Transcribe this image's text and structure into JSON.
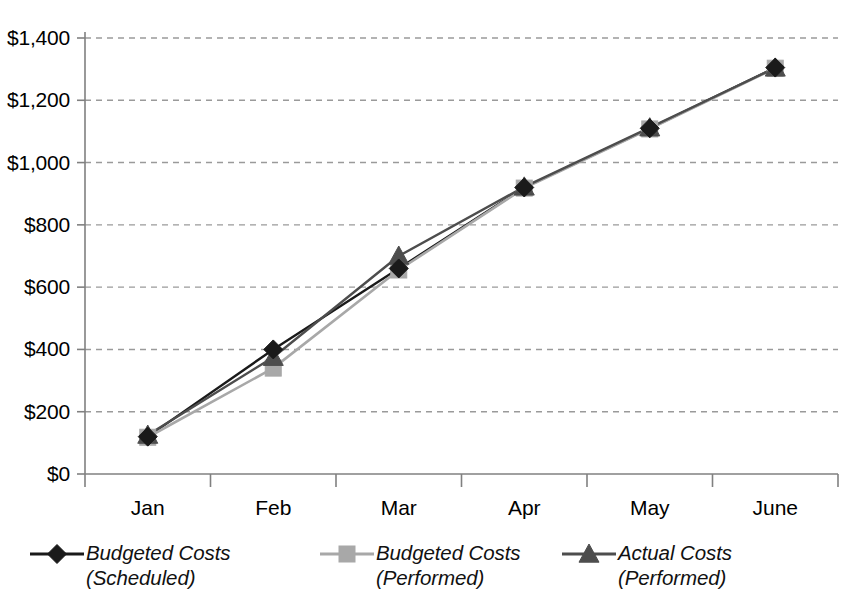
{
  "chart_data": {
    "type": "line",
    "title": "",
    "subtitle": "",
    "xlabel": "",
    "ylabel": "",
    "categories": [
      "Jan",
      "Feb",
      "Mar",
      "Apr",
      "May",
      "June"
    ],
    "ylim": [
      0,
      1400
    ],
    "ytick_values": [
      0,
      200,
      400,
      600,
      800,
      1000,
      1200,
      1400
    ],
    "ytick_labels": [
      "$0",
      "$200",
      "$400",
      "$600",
      "$800",
      "$1,000",
      "$1,200",
      "$1,400"
    ],
    "grid": "horizontal-dashed",
    "legend_position": "bottom",
    "series": [
      {
        "name": "Budgeted Costs (Scheduled)",
        "marker": "diamond",
        "color": "#1a1a1a",
        "values": [
          120,
          400,
          660,
          920,
          1110,
          1305
        ]
      },
      {
        "name": "Budgeted Costs (Performed)",
        "marker": "square",
        "color": "#a8a8a8",
        "values": [
          118,
          340,
          655,
          918,
          1108,
          1303
        ]
      },
      {
        "name": "Actual Costs (Performed)",
        "marker": "triangle",
        "color": "#4d4d4d",
        "values": [
          125,
          375,
          700,
          922,
          1112,
          1304
        ]
      }
    ]
  },
  "axes": {
    "y_labels": [
      "$1,400",
      "$1,200",
      "$1,000",
      "$800",
      "$600",
      "$400",
      "$200",
      "$0"
    ],
    "x_labels": [
      "Jan",
      "Feb",
      "Mar",
      "Apr",
      "May",
      "June"
    ]
  },
  "legend": {
    "items": [
      {
        "label": "Budgeted Costs\n(Scheduled)",
        "marker": "diamond",
        "color": "#1a1a1a"
      },
      {
        "label": "Budgeted Costs\n(Performed)",
        "marker": "square",
        "color": "#a8a8a8"
      },
      {
        "label": "Actual Costs\n(Performed)",
        "marker": "triangle",
        "color": "#4d4d4d"
      }
    ]
  },
  "colors": {
    "axis": "#808080",
    "grid": "#9a9a9a",
    "series_scheduled": "#1a1a1a",
    "series_performed_budget": "#a8a8a8",
    "series_actual": "#4d4d4d",
    "background": "#ffffff"
  }
}
